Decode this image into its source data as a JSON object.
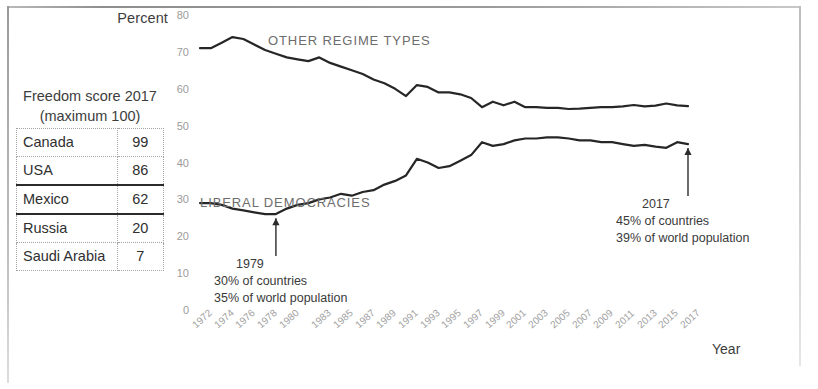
{
  "axis": {
    "y_title": "Percent",
    "x_title": "Year"
  },
  "table": {
    "title_line1": "Freedom score 2017",
    "title_line2": "(maximum 100)",
    "rows": [
      {
        "country": "Canada",
        "score": "99"
      },
      {
        "country": "USA",
        "score": "86"
      },
      {
        "country": "Mexico",
        "score": "62"
      },
      {
        "country": "Russia",
        "score": "20"
      },
      {
        "country": "Saudi Arabia",
        "score": "7"
      }
    ]
  },
  "annotations": {
    "left": {
      "year": "1979",
      "line1": "30% of countries",
      "line2": "35% of world population"
    },
    "right": {
      "year": "2017",
      "line1": "45% of countries",
      "line2": "39% of world population"
    }
  },
  "chart_data": {
    "type": "line",
    "title": "",
    "xlabel": "Year",
    "ylabel": "Percent",
    "ylim": [
      0,
      80
    ],
    "yticks": [
      0,
      10,
      20,
      30,
      40,
      50,
      60,
      70,
      80
    ],
    "xlim": [
      1972,
      2017
    ],
    "xticks": [
      1972,
      1974,
      1976,
      1978,
      1980,
      1983,
      1985,
      1987,
      1989,
      1991,
      1993,
      1995,
      1997,
      1999,
      2001,
      2003,
      2005,
      2007,
      2009,
      2011,
      2013,
      2015,
      2017
    ],
    "grid": false,
    "legend_position": "inline-labels",
    "line_color": "#262626",
    "x": [
      1972,
      1973,
      1974,
      1975,
      1976,
      1977,
      1978,
      1979,
      1980,
      1981,
      1982,
      1983,
      1984,
      1985,
      1986,
      1987,
      1988,
      1989,
      1990,
      1991,
      1992,
      1993,
      1994,
      1995,
      1996,
      1997,
      1998,
      1999,
      2000,
      2001,
      2002,
      2003,
      2004,
      2005,
      2006,
      2007,
      2008,
      2009,
      2010,
      2011,
      2012,
      2013,
      2014,
      2015,
      2016,
      2017
    ],
    "series": [
      {
        "name": "OTHER REGIME TYPES",
        "values": [
          71,
          71,
          72.5,
          74,
          73.5,
          72,
          70.5,
          69.5,
          68.5,
          68,
          67.5,
          68.5,
          67,
          66,
          65,
          64,
          62.5,
          61.5,
          60,
          58,
          61,
          60.5,
          59,
          59,
          58.5,
          57.5,
          55,
          56.5,
          55.5,
          56.5,
          55,
          55,
          54.8,
          54.8,
          54.5,
          54.6,
          54.8,
          55,
          55,
          55.2,
          55.6,
          55.2,
          55.4,
          56,
          55.5,
          55.3
        ]
      },
      {
        "name": "LIBERAL DEMOCRACIES",
        "values": [
          29,
          29,
          28.5,
          27.5,
          27,
          26.5,
          26,
          26,
          27.5,
          28.5,
          29,
          30,
          30.5,
          31.5,
          31,
          32,
          32.5,
          34,
          35,
          36.5,
          41,
          40,
          38.5,
          39,
          40.5,
          42,
          45.5,
          44.5,
          45,
          46,
          46.5,
          46.5,
          46.8,
          46.8,
          46.5,
          46,
          46,
          45.5,
          45.5,
          45,
          44.5,
          44.8,
          44.3,
          44,
          45.5,
          45
        ]
      }
    ],
    "annotations": [
      {
        "x": 1979,
        "label": "1979",
        "detail1": "30% of countries",
        "detail2": "35% of world population",
        "series": "LIBERAL DEMOCRACIES",
        "y": 26
      },
      {
        "x": 2017,
        "label": "2017",
        "detail1": "45% of countries",
        "detail2": "39% of world population",
        "series": "LIBERAL DEMOCRACIES",
        "y": 45
      }
    ]
  }
}
